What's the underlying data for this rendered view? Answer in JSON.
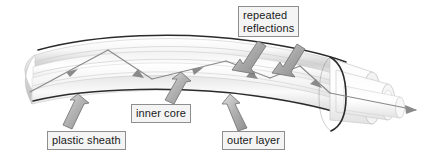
{
  "figure": {
    "background_color": "#ffffff",
    "labels": {
      "repeated_reflections": {
        "line1": "repeated",
        "line2": "reflections",
        "box_fill": "#f4f4f4",
        "box_border": "#8e8e8e",
        "text_color": "#1a1a1a"
      },
      "inner_core": {
        "text": "inner core",
        "box_fill": "#f4f4f4",
        "box_border": "#8e8e8e",
        "text_color": "#1a1a1a"
      },
      "plastic_sheath": {
        "text": "plastic sheath",
        "box_fill": "#f4f4f4",
        "box_border": "#8e8e8e",
        "text_color": "#1a1a1a"
      },
      "outer_layer": {
        "text": "outer layer",
        "box_fill": "#f4f4f4",
        "box_border": "#8e8e8e",
        "text_color": "#1a1a1a"
      }
    },
    "colors": {
      "cable_outline_dark": "#2b2b2b",
      "cable_body_light": "#fdfdfd",
      "cable_body_shade": "#c9c9c9",
      "cable_edge_grey": "#b5b5b5",
      "ray_line": "#8a8a8a",
      "callout_arrow_fill": "#b0b0b0",
      "callout_arrow_stroke": "#6e6e6e",
      "tube_glass": "#dcdcdc"
    },
    "ray": {
      "description": "light ray entering left, bouncing off inner core walls, exiting right",
      "arrowhead_count": 6,
      "exit_arrow_x": 418,
      "exit_arrow_y": 110
    },
    "callout_arrows": [
      {
        "name": "plastic-sheath-arrow",
        "points_to": "plastic sheath",
        "direction": "up-right"
      },
      {
        "name": "inner-core-arrow",
        "points_to": "inner core",
        "direction": "up-right"
      },
      {
        "name": "outer-layer-arrow",
        "points_to": "outer layer",
        "direction": "up-right"
      },
      {
        "name": "repeated-reflections-arrow-left",
        "points_to": "reflection point left",
        "direction": "down-left"
      },
      {
        "name": "repeated-reflections-arrow-right",
        "points_to": "reflection point right",
        "direction": "down-left"
      }
    ]
  }
}
